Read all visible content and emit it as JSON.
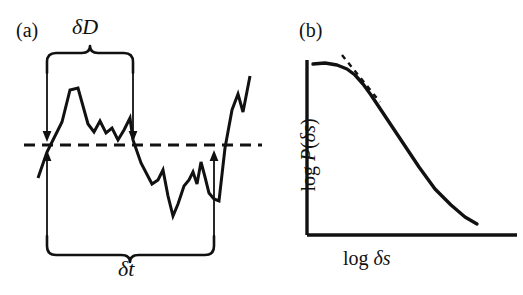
{
  "figure": {
    "background_color": "#ffffff",
    "ink_color": "#111111",
    "width": 523,
    "height": 295
  },
  "panel_a": {
    "label": "(a)",
    "caption_delta_d": "δD",
    "caption_delta_t": "δt",
    "threshold_line_style": "dashed",
    "description": "time series trace crossing a horizontal dashed threshold",
    "annotations": {
      "delta_d_brace_label": "δD",
      "delta_t_brace_label": "δt",
      "down_arrow_left": "down-arrow",
      "down_arrow_right": "down-arrow",
      "up_arrow_left": "up-arrow",
      "up_arrow_right": "up-arrow"
    }
  },
  "panel_b": {
    "label": "(b)",
    "xlabel": "log δs",
    "ylabel": "log P(δs)",
    "ylabel_parts": {
      "log": "log ",
      "p": "P",
      "open": "(",
      "ds": "δs",
      "close": ")"
    },
    "xlabel_parts": {
      "log": "log ",
      "ds": "δs"
    },
    "tangent_line_style": "dashed"
  },
  "chart_data": [
    {
      "type": "line",
      "name": "panel-a-timeseries",
      "title": "(a)",
      "xlabel": "",
      "ylabel": "",
      "grid": false,
      "legend": null,
      "xlim": [
        0,
        285
      ],
      "ylim": [
        295,
        0
      ],
      "annotations": [
        {
          "text": "δD",
          "type": "brace-span",
          "x_start": 47,
          "x_end": 133
        },
        {
          "text": "δt",
          "type": "brace-span",
          "x_start": 47,
          "x_end": 214
        }
      ],
      "threshold_y": 145,
      "points": [
        [
          38,
          178
        ],
        [
          47,
          152
        ],
        [
          56,
          134
        ],
        [
          62,
          122
        ],
        [
          70,
          90
        ],
        [
          78,
          88
        ],
        [
          88,
          124
        ],
        [
          94,
          132
        ],
        [
          100,
          121
        ],
        [
          106,
          133
        ],
        [
          112,
          128
        ],
        [
          118,
          140
        ],
        [
          124,
          130
        ],
        [
          130,
          118
        ],
        [
          133,
          140
        ],
        [
          141,
          163
        ],
        [
          152,
          184
        ],
        [
          158,
          180
        ],
        [
          163,
          170
        ],
        [
          168,
          196
        ],
        [
          173,
          216
        ],
        [
          178,
          204
        ],
        [
          184,
          186
        ],
        [
          189,
          180
        ],
        [
          193,
          172
        ],
        [
          197,
          184
        ],
        [
          201,
          162
        ],
        [
          205,
          177
        ],
        [
          209,
          193
        ],
        [
          214,
          199
        ],
        [
          219,
          201
        ],
        [
          225,
          148
        ],
        [
          232,
          110
        ],
        [
          238,
          94
        ],
        [
          243,
          112
        ],
        [
          250,
          76
        ]
      ]
    },
    {
      "type": "line",
      "name": "panel-b-powerlaw",
      "title": "(b)",
      "xlabel": "log δs",
      "ylabel": "log P(δs)",
      "grid": false,
      "legend": null,
      "xlim": [
        0,
        238
      ],
      "ylim": [
        295,
        0
      ],
      "axis_origin": [
        22,
        235
      ],
      "axis_x_end": 232,
      "axis_y_top": 60,
      "curve_points": [
        [
          28,
          64
        ],
        [
          40,
          63
        ],
        [
          52,
          65
        ],
        [
          62,
          69
        ],
        [
          70,
          75
        ],
        [
          78,
          84
        ],
        [
          86,
          95
        ],
        [
          96,
          110
        ],
        [
          108,
          128
        ],
        [
          120,
          146
        ],
        [
          134,
          167
        ],
        [
          150,
          189
        ],
        [
          166,
          205
        ],
        [
          180,
          217
        ],
        [
          192,
          224
        ]
      ],
      "tangent_points": [
        [
          57,
          55
        ],
        [
          95,
          102
        ]
      ]
    }
  ]
}
